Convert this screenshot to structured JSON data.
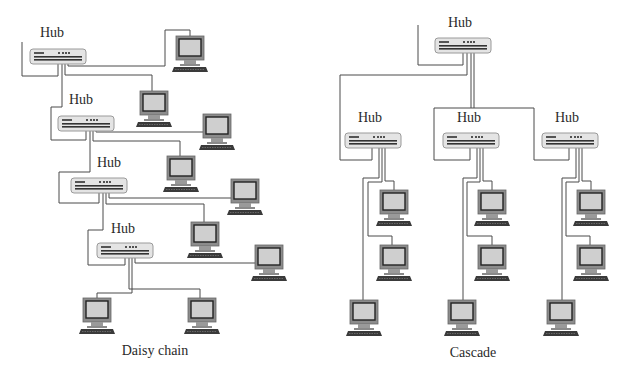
{
  "diagrams": [
    {
      "id": "daisy",
      "caption": "Daisy chain",
      "hubs": [
        {
          "label": "Hub"
        },
        {
          "label": "Hub"
        },
        {
          "label": "Hub"
        },
        {
          "label": "Hub"
        }
      ],
      "computers": 9
    },
    {
      "id": "cascade",
      "caption": "Cascade",
      "hubs": [
        {
          "label": "Hub"
        },
        {
          "label": "Hub"
        },
        {
          "label": "Hub"
        },
        {
          "label": "Hub"
        }
      ],
      "computers": 9
    }
  ],
  "colors": {
    "line": "#4a4a4a",
    "hub_fill": "#e4e4e4",
    "hub_border": "#9a9a9a",
    "monitor_frame": "#8c8c8c",
    "monitor_screen": "#cfcfcf",
    "keyboard": "#3a3a3a"
  }
}
